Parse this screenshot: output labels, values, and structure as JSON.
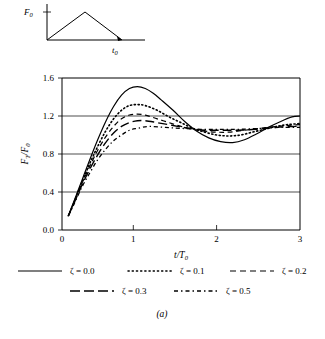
{
  "caption": "(a)",
  "inset": {
    "name": "triangular-pulse-diagram",
    "y_label": "F",
    "y_label_sub": "0",
    "x_label": "t",
    "x_label_sub": "0",
    "description": "Triangular force pulse rising to F0 then decaying to zero at t0"
  },
  "axes": {
    "x_title": "t/T",
    "x_title_sub": "0",
    "y_title": "F",
    "y_title_sub1": "T",
    "y_title_mid": "/F",
    "y_title_sub2": "0",
    "x_ticks": [
      "0",
      "1",
      "2",
      "3"
    ],
    "y_ticks": [
      "0.0",
      "0.4",
      "0.8",
      "1.2",
      "1.6"
    ]
  },
  "legend": {
    "row1": [
      {
        "label": "ζ = 0.0",
        "style": "solid"
      },
      {
        "label": "ζ = 0.1",
        "style": "dotted"
      },
      {
        "label": "ζ = 0.2",
        "style": "dashed"
      }
    ],
    "row2": [
      {
        "label": "ζ = 0.3",
        "style": "longdash"
      },
      {
        "label": "ζ = 0.5",
        "style": "dashdot"
      }
    ]
  },
  "chart_data": {
    "type": "line",
    "title": "",
    "xlabel": "t/T0",
    "ylabel": "FT/F0",
    "xlim": [
      0,
      3
    ],
    "ylim": [
      0.0,
      1.6
    ],
    "xticks": [
      0,
      1,
      2,
      3
    ],
    "yticks": [
      0.0,
      0.4,
      0.8,
      1.2,
      1.6
    ],
    "grid": "horizontal",
    "legend_position": "below-axes",
    "line_color": "#000000",
    "series": [
      {
        "name": "ζ = 0.0",
        "zeta": 0.0,
        "dash": "solid",
        "x": [
          0.08,
          0.15,
          0.25,
          0.35,
          0.45,
          0.55,
          0.65,
          0.75,
          0.85,
          0.95,
          1.05,
          1.15,
          1.25,
          1.4,
          1.55,
          1.7,
          1.85,
          2.0,
          2.15,
          2.3,
          2.45,
          2.6,
          2.75,
          2.9,
          3.0
        ],
        "y": [
          0.15,
          0.3,
          0.52,
          0.74,
          0.95,
          1.14,
          1.3,
          1.42,
          1.49,
          1.51,
          1.49,
          1.44,
          1.37,
          1.26,
          1.14,
          1.04,
          0.97,
          0.93,
          0.92,
          0.95,
          1.01,
          1.08,
          1.14,
          1.19,
          1.2
        ]
      },
      {
        "name": "ζ = 0.1",
        "zeta": 0.1,
        "dash": "dotted",
        "x": [
          0.08,
          0.15,
          0.25,
          0.35,
          0.45,
          0.55,
          0.65,
          0.75,
          0.85,
          0.95,
          1.05,
          1.2,
          1.35,
          1.5,
          1.65,
          1.8,
          1.95,
          2.1,
          2.25,
          2.4,
          2.55,
          2.7,
          2.85,
          3.0
        ],
        "y": [
          0.15,
          0.29,
          0.5,
          0.7,
          0.88,
          1.04,
          1.17,
          1.26,
          1.31,
          1.32,
          1.31,
          1.26,
          1.19,
          1.13,
          1.07,
          1.03,
          1.0,
          0.99,
          1.0,
          1.03,
          1.06,
          1.09,
          1.11,
          1.12
        ]
      },
      {
        "name": "ζ = 0.2",
        "zeta": 0.2,
        "dash": "dashed",
        "x": [
          0.08,
          0.15,
          0.25,
          0.35,
          0.45,
          0.55,
          0.65,
          0.75,
          0.85,
          0.95,
          1.05,
          1.2,
          1.35,
          1.5,
          1.65,
          1.8,
          1.95,
          2.1,
          2.3,
          2.5,
          2.7,
          2.85,
          3.0
        ],
        "y": [
          0.15,
          0.29,
          0.49,
          0.67,
          0.84,
          0.98,
          1.09,
          1.17,
          1.21,
          1.22,
          1.21,
          1.17,
          1.13,
          1.09,
          1.06,
          1.04,
          1.03,
          1.03,
          1.05,
          1.07,
          1.09,
          1.1,
          1.11
        ]
      },
      {
        "name": "ζ = 0.3",
        "zeta": 0.3,
        "dash": "longdash",
        "x": [
          0.08,
          0.15,
          0.25,
          0.35,
          0.45,
          0.55,
          0.65,
          0.75,
          0.85,
          0.95,
          1.05,
          1.2,
          1.4,
          1.6,
          1.8,
          2.0,
          2.2,
          2.45,
          2.7,
          2.9,
          3.0
        ],
        "y": [
          0.15,
          0.28,
          0.47,
          0.64,
          0.79,
          0.92,
          1.02,
          1.09,
          1.13,
          1.15,
          1.15,
          1.13,
          1.1,
          1.07,
          1.05,
          1.05,
          1.05,
          1.06,
          1.08,
          1.09,
          1.09
        ]
      },
      {
        "name": "ζ = 0.5",
        "zeta": 0.5,
        "dash": "dashdot",
        "x": [
          0.08,
          0.15,
          0.25,
          0.35,
          0.45,
          0.55,
          0.65,
          0.75,
          0.85,
          0.95,
          1.1,
          1.3,
          1.5,
          1.75,
          2.0,
          2.25,
          2.5,
          2.75,
          3.0
        ],
        "y": [
          0.15,
          0.27,
          0.45,
          0.6,
          0.74,
          0.85,
          0.94,
          1.0,
          1.05,
          1.07,
          1.09,
          1.08,
          1.07,
          1.06,
          1.06,
          1.06,
          1.07,
          1.08,
          1.08
        ]
      }
    ]
  }
}
